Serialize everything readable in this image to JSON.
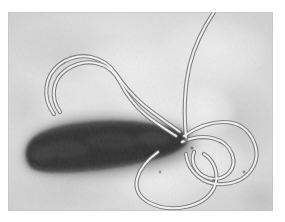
{
  "figure": {
    "title": "Transmission electron micrograph of a flagellated rod-shaped bacterium",
    "modality": "transmission-electron-microscopy",
    "color_mode": "grayscale",
    "border": {
      "present": true,
      "color": "#ffffff",
      "inset_left_px": 8,
      "inset_top_px": 12,
      "inset_right_px": 12,
      "inset_bottom_px": 11
    },
    "canvas": {
      "width_px": 285,
      "height_px": 222
    },
    "image_area": {
      "x_px": 8,
      "y_px": 12,
      "width_px": 265,
      "height_px": 199
    }
  },
  "palette": {
    "border_white": "#ffffff",
    "background_light": "#e2e2e2",
    "background_mid": "#d2d2d2",
    "background_shadow": "#b4b4b4",
    "halo_gray": "#9a9a9a",
    "cell_body_dark": "#3b3b3b",
    "cell_body_darkest": "#2a2a2a",
    "cell_body_edge": "#5a5a5a",
    "flagellum_core": "#f2f2f2",
    "flagellum_outline": "#7a7a7a",
    "grain_dark": "#bcbcbc"
  },
  "specimen": {
    "organism_shape": "rod",
    "cell_body": {
      "label": "bacterial-cell-body",
      "pole_left_px": [
        14,
        148
      ],
      "pole_right_px": [
        175,
        122
      ],
      "max_width_px": 58,
      "orientation_deg": -12,
      "fill": "#3b3b3b"
    },
    "halo": {
      "label": "electron-dense-halo",
      "fill": "#9a9a9a",
      "blur_px": 7
    },
    "flagella_count": 5,
    "flagella": [
      {
        "id": "flagellum-upper-left-loop",
        "description": "long filament looping up and left above the cell, returning toward the right pole",
        "path": "M 172 120 C 150 104, 128 92, 108 62 C 96 44, 72 38, 52 52 C 36 64, 34 86, 46 102"
      },
      {
        "id": "flagellum-top-exit",
        "description": "filament sweeping up and off the top edge of the frame",
        "path": "M 178 126 C 176 104, 176 76, 182 52 C 188 28, 198 12, 206 0"
      },
      {
        "id": "flagellum-right-large-loop",
        "description": "large loop on the right side curving clockwise back to the pole",
        "path": "M 176 124 C 202 106, 232 104, 244 126 C 256 148, 242 170, 216 172 C 196 174, 180 160, 178 142"
      },
      {
        "id": "flagellum-right-inner-loop",
        "description": "smaller inner loop nested within the right bundle",
        "path": "M 174 130 C 196 120, 218 126, 224 142 C 230 158, 216 170, 200 166 C 188 162, 182 150, 186 140"
      },
      {
        "id": "flagellum-lower-u-loop",
        "description": "filament descending below the cell in a broad U and rising on the right",
        "path": "M 150 140 C 128 156, 120 178, 140 190 C 162 202, 196 196, 206 176 C 212 162, 206 148, 196 142"
      }
    ]
  },
  "annotations": {
    "scale_bar_present": false,
    "text_labels_present": false,
    "visible_text": ""
  }
}
